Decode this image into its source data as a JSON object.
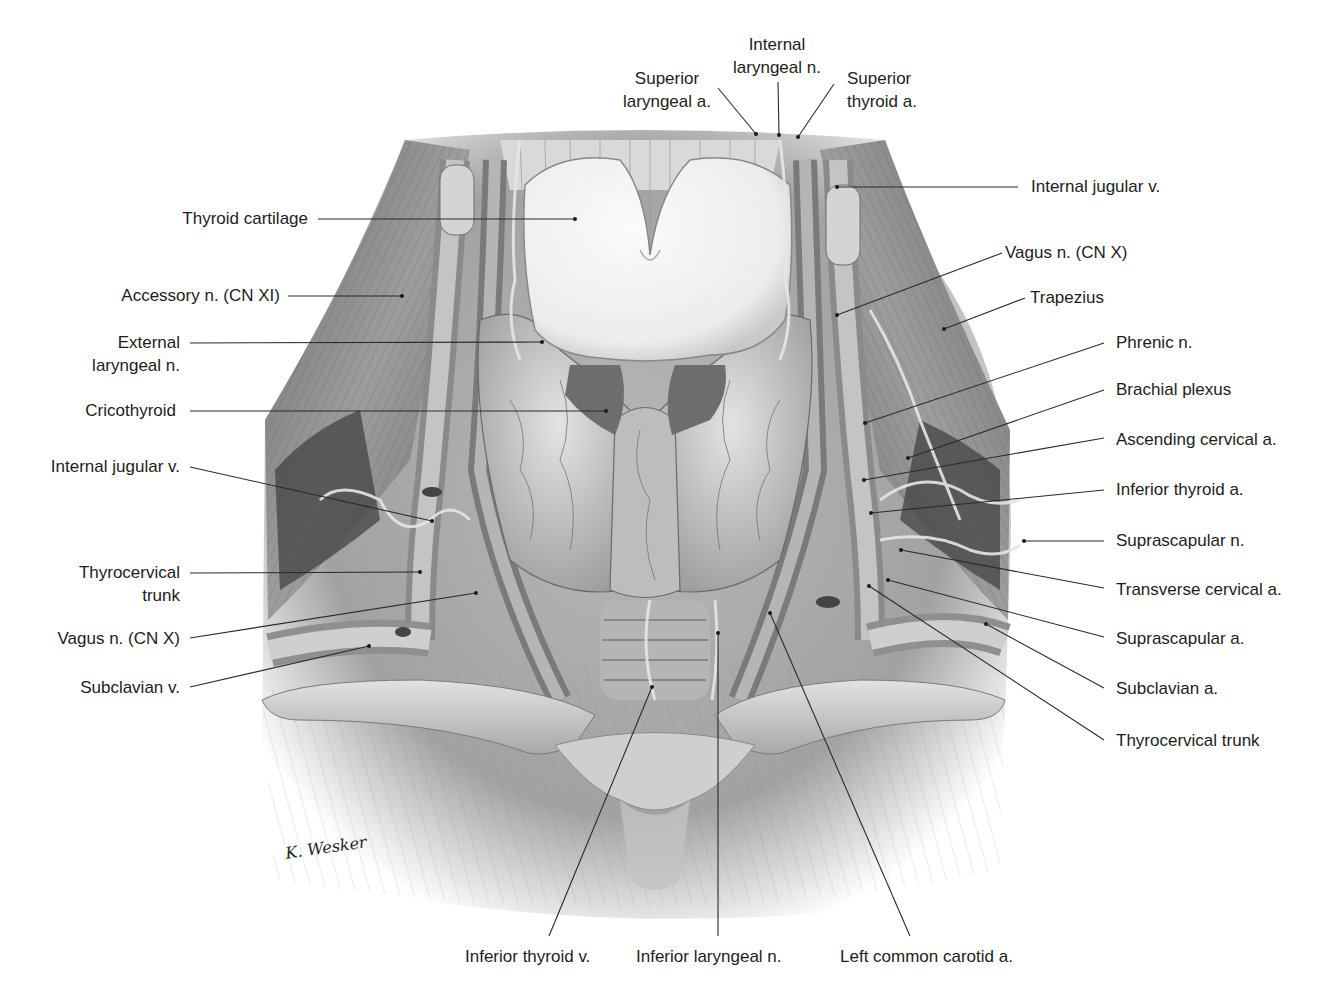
{
  "figure": {
    "signature": "K. Wesker",
    "palette": {
      "ink": "#1d1d1b",
      "leader": "#2a2a2a",
      "background": "#ffffff",
      "cartilage": "#f3f3f3",
      "muscle_dark": "#5a5a5a",
      "muscle_mid": "#9a9a9a",
      "gland": "#c9c9c9"
    }
  },
  "labels": {
    "top": [
      {
        "id": "superior-laryngeal-a",
        "text": "Superior\nlaryngeal a."
      },
      {
        "id": "internal-laryngeal-n",
        "text": "Internal\nlaryngeal n."
      },
      {
        "id": "superior-thyroid-a",
        "text": "Superior\nthyroid a."
      }
    ],
    "left": [
      {
        "id": "thyroid-cartilage",
        "text": "Thyroid cartilage"
      },
      {
        "id": "accessory-n",
        "text": "Accessory n. (CN XI)"
      },
      {
        "id": "external-laryngeal-n",
        "text": "External\nlaryngeal n."
      },
      {
        "id": "cricothyroid",
        "text": "Cricothyroid"
      },
      {
        "id": "internal-jugular-v-left",
        "text": "Internal jugular v."
      },
      {
        "id": "thyrocervical-trunk-left",
        "text": "Thyrocervical\ntrunk"
      },
      {
        "id": "vagus-n-left",
        "text": "Vagus n. (CN X)"
      },
      {
        "id": "subclavian-v",
        "text": "Subclavian v."
      }
    ],
    "right": [
      {
        "id": "internal-jugular-v-right",
        "text": "Internal jugular v."
      },
      {
        "id": "vagus-n-right",
        "text": "Vagus n. (CN X)"
      },
      {
        "id": "trapezius",
        "text": "Trapezius"
      },
      {
        "id": "phrenic-n",
        "text": "Phrenic n."
      },
      {
        "id": "brachial-plexus",
        "text": "Brachial plexus"
      },
      {
        "id": "ascending-cervical-a",
        "text": "Ascending cervical a."
      },
      {
        "id": "inferior-thyroid-a",
        "text": "Inferior thyroid a."
      },
      {
        "id": "suprascapular-n",
        "text": "Suprascapular n."
      },
      {
        "id": "transverse-cervical-a",
        "text": "Transverse cervical a."
      },
      {
        "id": "suprascapular-a",
        "text": "Suprascapular a."
      },
      {
        "id": "subclavian-a",
        "text": "Subclavian a."
      },
      {
        "id": "thyrocervical-trunk-right",
        "text": "Thyrocervical trunk"
      }
    ],
    "bottom": [
      {
        "id": "inferior-thyroid-v",
        "text": "Inferior thyroid v."
      },
      {
        "id": "inferior-laryngeal-n",
        "text": "Inferior laryngeal n."
      },
      {
        "id": "left-common-carotid-a",
        "text": "Left common carotid a."
      }
    ]
  }
}
